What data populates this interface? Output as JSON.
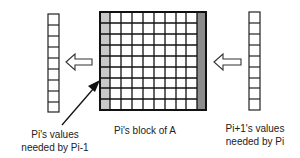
{
  "labels": {
    "left": [
      "Pi's values",
      "needed by Pi-1"
    ],
    "center": "Pi's block of A",
    "right": [
      "Pi+1's values",
      "needed by Pi"
    ]
  },
  "grid": {
    "rows": 9,
    "cols": 10,
    "shaded_left_color": "#c8c8c8",
    "shaded_right_color": "#8c8c8c"
  },
  "columns": {
    "left_cells": 9,
    "right_cells": 9
  },
  "arrows": [
    "left-hollow-arrow",
    "right-hollow-arrow",
    "pointer-arrow"
  ]
}
